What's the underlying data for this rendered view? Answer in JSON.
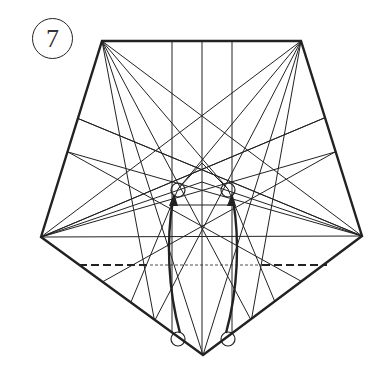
{
  "step": {
    "number": "7"
  },
  "diagram": {
    "colors": {
      "line": "#222222",
      "background": "#ffffff"
    },
    "outline": [
      [
        102,
        41
      ],
      [
        301,
        41
      ],
      [
        362,
        236
      ],
      [
        203,
        355
      ],
      [
        41,
        237
      ]
    ],
    "crease_lines": [
      [
        102,
        41,
        203,
        355
      ],
      [
        301,
        41,
        203,
        355
      ],
      [
        102,
        41,
        362,
        236
      ],
      [
        301,
        41,
        41,
        237
      ],
      [
        102,
        41,
        228,
        189
      ],
      [
        301,
        41,
        178,
        189
      ],
      [
        102,
        41,
        160,
        350
      ],
      [
        301,
        41,
        246,
        350
      ],
      [
        102,
        41,
        251,
        320
      ],
      [
        301,
        41,
        155,
        320
      ],
      [
        172,
        41,
        172,
        338
      ],
      [
        202,
        41,
        202,
        355
      ],
      [
        232,
        41,
        232,
        338
      ],
      [
        41,
        237,
        362,
        236
      ],
      [
        41,
        237,
        202,
        182
      ],
      [
        362,
        236,
        202,
        182
      ],
      [
        41,
        237,
        329,
        116
      ],
      [
        362,
        236,
        72,
        116
      ],
      [
        41,
        237,
        335,
        152
      ],
      [
        362,
        236,
        68,
        152
      ],
      [
        72,
        116,
        362,
        236
      ],
      [
        68,
        152,
        335,
        300
      ],
      [
        329,
        116,
        41,
        237
      ],
      [
        335,
        152,
        70,
        300
      ],
      [
        172,
        205,
        232,
        205
      ],
      [
        202,
        163,
        178,
        189
      ],
      [
        202,
        163,
        228,
        189
      ],
      [
        131,
        302,
        178,
        189
      ],
      [
        275,
        302,
        228,
        189
      ]
    ],
    "valley_fold": {
      "x1": 79,
      "y1": 265,
      "x2": 327,
      "y2": 265,
      "dash_left": [
        79,
        150
      ],
      "dash_right": [
        262,
        327
      ]
    },
    "markers": {
      "circles": [
        {
          "cx": 178,
          "cy": 190,
          "r": 7
        },
        {
          "cx": 228,
          "cy": 190,
          "r": 7
        },
        {
          "cx": 178,
          "cy": 339,
          "r": 7
        },
        {
          "cx": 228,
          "cy": 339,
          "r": 7
        }
      ],
      "arrows": [
        {
          "path": "M180,333 C168,290 166,240 173,200",
          "tip": [
            174,
            193
          ]
        },
        {
          "path": "M226,333 C238,290 240,240 233,200",
          "tip": [
            232,
            193
          ]
        }
      ]
    }
  }
}
